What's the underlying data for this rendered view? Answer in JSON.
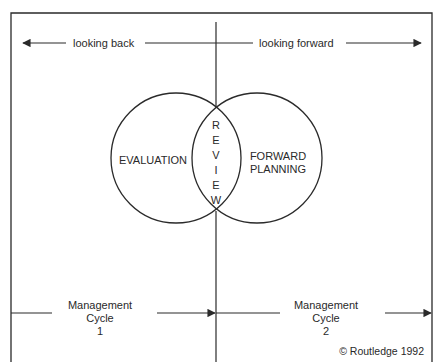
{
  "diagram": {
    "top_arrows": {
      "left_label": "looking back",
      "right_label": "looking forward"
    },
    "circles": {
      "left_label": "EVALUATION",
      "overlap_label_letters": [
        "R",
        "E",
        "V",
        "I",
        "E",
        "W"
      ],
      "right_label_line1": "FORWARD",
      "right_label_line2": "PLANNING"
    },
    "bottom_arrows": {
      "cycle1": {
        "line1": "Management",
        "line2": "Cycle",
        "line3": "1"
      },
      "cycle2": {
        "line1": "Management",
        "line2": "Cycle",
        "line3": "2"
      }
    },
    "copyright": "© Routledge 1992",
    "colors": {
      "stroke": "#2a2a2a",
      "background": "#ffffff"
    }
  }
}
